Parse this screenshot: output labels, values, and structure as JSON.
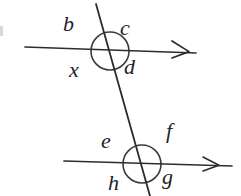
{
  "figure": {
    "background_color": "#ffffff",
    "ink_color": "#23232b",
    "width": 241,
    "height": 196
  },
  "labels": {
    "b": "b",
    "c": "c",
    "x": "x",
    "d": "d",
    "e": "e",
    "f": "f",
    "h": "h",
    "g": "g"
  },
  "geometry": {
    "top_line": {
      "name": "upper-parallel-line",
      "x1": 25,
      "y1": 47,
      "x2": 196,
      "y2": 53,
      "arrow_end": "right"
    },
    "bottom_line": {
      "name": "lower-parallel-line",
      "x1": 64,
      "y1": 161,
      "x2": 232,
      "y2": 166,
      "arrow_end": "right"
    },
    "transversal": {
      "name": "transversal-line",
      "x1": 96,
      "y1": 4,
      "x2": 150,
      "y2": 196
    },
    "upper_intersection": {
      "cx": 110,
      "cy": 51,
      "r": 19
    },
    "lower_intersection": {
      "cx": 142,
      "cy": 164,
      "r": 19
    }
  },
  "label_positions": {
    "b": {
      "left": 63,
      "top": 13
    },
    "c": {
      "left": 120,
      "top": 17
    },
    "x": {
      "left": 69,
      "top": 59
    },
    "d": {
      "left": 124,
      "top": 56
    },
    "e": {
      "left": 101,
      "top": 130
    },
    "f": {
      "left": 166,
      "top": 122
    },
    "h": {
      "left": 108,
      "top": 172
    },
    "g": {
      "left": 162,
      "top": 166
    }
  }
}
